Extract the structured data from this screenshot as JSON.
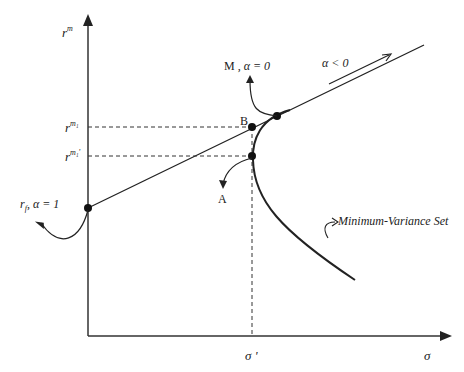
{
  "diagram": {
    "type": "capital-market-line",
    "axes": {
      "y_label": "r",
      "y_label_sup": "m",
      "x_label": "σ",
      "x_tick_label": "σ '",
      "y_tick_1_label": "r",
      "y_tick_1_sup": "m₁",
      "y_tick_2_label": "r",
      "y_tick_2_sup": "m₁'"
    },
    "annotations": {
      "rf_label": "r",
      "rf_sub": "f",
      "rf_alpha": ", α = 1",
      "m_label": "M , ",
      "m_alpha": "α = 0",
      "alpha_neg": "α < 0",
      "point_b": "B",
      "point_a": "A",
      "min_var_set": "Minimum-Variance Set"
    },
    "colors": {
      "line": "#222222",
      "background": "#ffffff"
    }
  }
}
